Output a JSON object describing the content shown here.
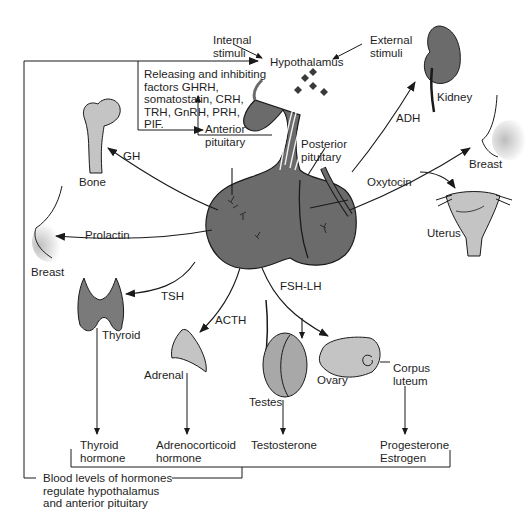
{
  "colors": {
    "pituitary": "#6b6b6b",
    "organ_dark": "#7a7a7a",
    "organ_light": "#c4c4c4",
    "line": "#1a1a1a",
    "background": "#ffffff"
  },
  "nodes": {
    "hypothalamus": "Hypothalamus",
    "internal_stimuli": "Internal\nstimuli",
    "external_stimuli": "External\nstimuli",
    "releasing_factors": "Releasing and inhibiting\nfactors GHRH,\nsomatostatin, CRH,\nTRH, GnRH, PRH,\nPIF.",
    "anterior_pituitary": "Anterior\npituitary",
    "posterior_pituitary": "Posterior\npituitary",
    "kidney": "Kidney",
    "bone": "Bone",
    "breast_right": "Breast",
    "breast_left": "Breast",
    "uterus": "Uterus",
    "thyroid": "Thyroid",
    "adrenal": "Adrenal",
    "testes": "Testes",
    "ovary": "Ovary",
    "corpus_luteum": "Corpus\nluteum"
  },
  "hormones": {
    "adh": "ADH",
    "gh": "GH",
    "oxytocin": "Oxytocin",
    "prolactin": "Prolactin",
    "tsh": "TSH",
    "acth": "ACTH",
    "fsh_lh": "FSH-LH"
  },
  "outputs": {
    "thyroid_hormone": "Thyroid\nhormone",
    "adrenocorticoid_hormone": "Adrenocorticoid\nhormone",
    "testosterone": "Testosterone",
    "progesterone_estrogen": "Progesterone\nEstrogen"
  },
  "feedback": {
    "label": "Blood levels of hormones\nregulate hypothalamus\nand anterior pituitary"
  }
}
